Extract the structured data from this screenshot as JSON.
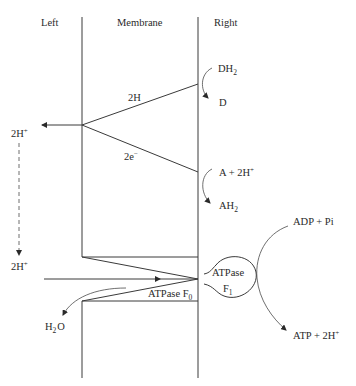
{
  "diagram": {
    "type": "membrane-electron-transport-atp-synthase",
    "regions": {
      "left": "Left",
      "membrane": "Membrane",
      "right": "Right"
    },
    "pathway_labels": {
      "hydrogen_transfer": "2H",
      "electron_transfer": "2e",
      "electron_charge": "−"
    },
    "donor_reaction": {
      "reactant": "DH",
      "reactant_sub": "2",
      "product": "D"
    },
    "acceptor_reaction": {
      "reactant": "A + 2H",
      "reactant_sup": "+",
      "product": "AH",
      "product_sub": "2"
    },
    "left_side": {
      "proton_top": "2H",
      "proton_top_sup": "+",
      "proton_bottom": "2H",
      "proton_bottom_sup": "+",
      "water": "H",
      "water_sub": "2",
      "water_tail": "O"
    },
    "atpase": {
      "f0_label": "ATPase  F",
      "f0_sub": "0",
      "f1_label": "ATPase",
      "f1_name": "F",
      "f1_sub": "1"
    },
    "phosphorylation": {
      "substrate": "ADP +  Pi",
      "product": "ATP + 2H",
      "product_sup": "+"
    },
    "colors": {
      "line": "#3a3a3a",
      "text": "#2a2a2a",
      "background": "#ffffff"
    }
  }
}
